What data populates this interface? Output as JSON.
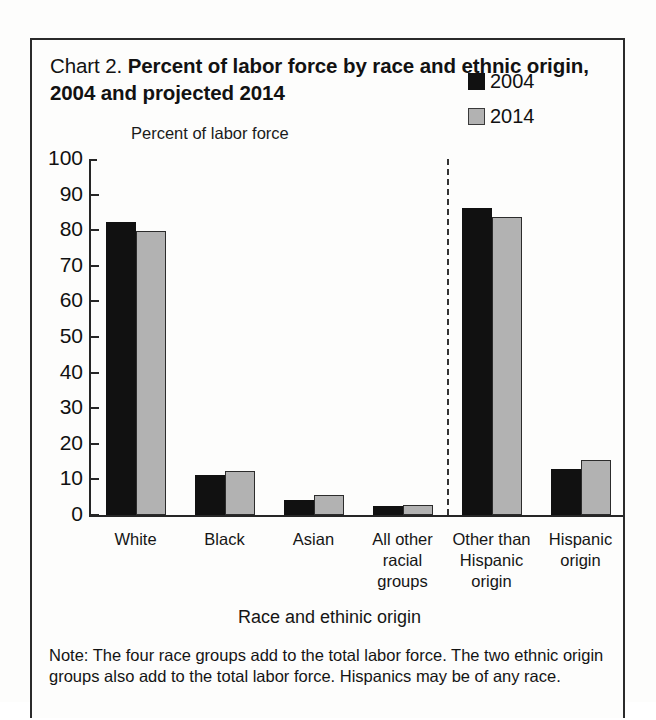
{
  "figure": {
    "label": "Chart 2.",
    "title": "Percent of labor force by race and ethnic origin, 2004 and projected 2014",
    "y_axis_title": "Percent of labor force",
    "x_axis_title": "Race and ethinic origin",
    "note": "Note: The four race groups add to the total labor force. The two ethnic origin groups also add to the total labor force. Hispanics may be of any race."
  },
  "legend": {
    "position": "top-right",
    "entries": [
      {
        "label": "2004",
        "color": "#111111"
      },
      {
        "label": "2014",
        "color": "#b2b2b2"
      }
    ]
  },
  "chart_data": {
    "type": "bar",
    "title": "Chart 2. Percent of labor force by race and ethnic origin, 2004 and projected 2014",
    "xlabel": "Race and ethinic origin",
    "ylabel": "Percent of labor force",
    "ylim": [
      0,
      100
    ],
    "yticks": [
      0,
      10,
      20,
      30,
      40,
      50,
      60,
      70,
      80,
      90,
      100
    ],
    "ytick_labels": [
      "0",
      "10",
      "20",
      "30",
      "40",
      "50",
      "60",
      "70",
      "80",
      "90",
      "100"
    ],
    "grid": false,
    "categories": [
      "White",
      "Black",
      "Asian",
      "All other racial groups",
      "Other than Hispanic origin",
      "Hispanic origin"
    ],
    "category_label_lines": [
      [
        "White"
      ],
      [
        "Black"
      ],
      [
        "Asian"
      ],
      [
        "All other",
        "racial",
        "groups"
      ],
      [
        "Other than",
        "Hispanic",
        "origin"
      ],
      [
        "Hispanic",
        "origin"
      ]
    ],
    "series": [
      {
        "name": "2004",
        "color": "#111111",
        "values": [
          82.3,
          11.3,
          4.3,
          2.6,
          86.3,
          13.0
        ]
      },
      {
        "name": "2014",
        "color": "#b2b2b2",
        "values": [
          79.9,
          12.4,
          5.5,
          2.7,
          83.7,
          15.4
        ]
      }
    ],
    "separator_after_category_index": 3,
    "annotations": [
      "Dashed vertical line separates the four race groups from the two ethnic origin groups."
    ]
  }
}
